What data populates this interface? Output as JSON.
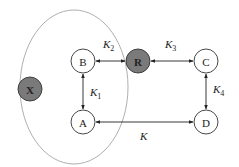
{
  "diagram": {
    "type": "reaction-network",
    "region": {
      "cx": 74,
      "cy": 87,
      "rx": 54,
      "ry": 77,
      "stroke": "#9a9a9a"
    },
    "node_radius": 12,
    "nodes": [
      {
        "id": "X",
        "label": "X",
        "x": 30,
        "y": 89,
        "fill": "#7a7a7a",
        "bold": true
      },
      {
        "id": "B",
        "label": "B",
        "x": 83,
        "y": 61,
        "fill": "#ffffff",
        "bold": false
      },
      {
        "id": "R",
        "label": "R",
        "x": 138,
        "y": 61,
        "fill": "#7a7a7a",
        "bold": true
      },
      {
        "id": "C",
        "label": "C",
        "x": 206,
        "y": 61,
        "fill": "#ffffff",
        "bold": false
      },
      {
        "id": "A",
        "label": "A",
        "x": 83,
        "y": 122,
        "fill": "#ffffff",
        "bold": false
      },
      {
        "id": "D",
        "label": "D",
        "x": 206,
        "y": 122,
        "fill": "#ffffff",
        "bold": false
      }
    ],
    "edges": [
      {
        "from": "B",
        "to": "R",
        "label": "K",
        "sub": "2",
        "lx": 103,
        "ly": 48,
        "bidirectional": true
      },
      {
        "from": "R",
        "to": "C",
        "label": "K",
        "sub": "3",
        "lx": 165,
        "ly": 48,
        "bidirectional": true
      },
      {
        "from": "B",
        "to": "A",
        "label": "K",
        "sub": "1",
        "lx": 90,
        "ly": 96,
        "bidirectional": true
      },
      {
        "from": "C",
        "to": "D",
        "label": "K",
        "sub": "4",
        "lx": 213,
        "ly": 93,
        "bidirectional": true
      },
      {
        "from": "A",
        "to": "D",
        "label": "K",
        "sub": "",
        "lx": 140,
        "ly": 140,
        "bidirectional": true
      }
    ],
    "colors": {
      "line": "#222222",
      "node_stroke": "#333333",
      "shaded": "#7a7a7a"
    }
  }
}
